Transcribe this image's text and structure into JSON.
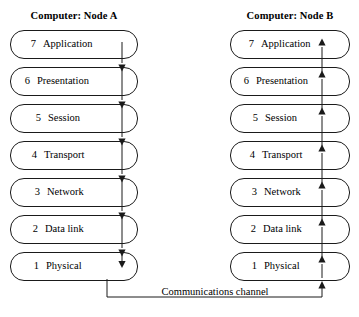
{
  "diagram": {
    "stroke_color": "#1a1a1a",
    "background_color": "#ffffff"
  },
  "nodes": [
    {
      "id": "node-a",
      "header": "Computer: Node A",
      "flow_direction": "down",
      "layers": [
        {
          "number": "7",
          "label": "Application"
        },
        {
          "number": "6",
          "label": "Presentation"
        },
        {
          "number": "5",
          "label": "Session"
        },
        {
          "number": "4",
          "label": "Transport"
        },
        {
          "number": "3",
          "label": "Network"
        },
        {
          "number": "2",
          "label": "Data link"
        },
        {
          "number": "1",
          "label": "Physical"
        }
      ]
    },
    {
      "id": "node-b",
      "header": "Computer: Node B",
      "flow_direction": "up",
      "layers": [
        {
          "number": "7",
          "label": "Application"
        },
        {
          "number": "6",
          "label": "Presentation"
        },
        {
          "number": "5",
          "label": "Session"
        },
        {
          "number": "4",
          "label": "Transport"
        },
        {
          "number": "3",
          "label": "Network"
        },
        {
          "number": "2",
          "label": "Data link"
        },
        {
          "number": "1",
          "label": "Physical"
        }
      ]
    }
  ],
  "channel": {
    "label": "Communications channel"
  }
}
